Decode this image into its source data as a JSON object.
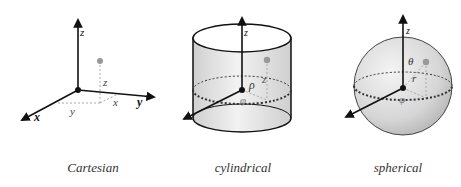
{
  "panels": [
    {
      "id": "cartesian",
      "caption": "Cartesian",
      "axis_labels": {
        "x": "x",
        "y": "y",
        "z": "z"
      },
      "coordinate_labels": {
        "x": "x",
        "y": "y",
        "z": "z"
      }
    },
    {
      "id": "cylindrical",
      "caption": "cylindrical",
      "axis_labels": {
        "z": "z"
      },
      "coordinate_labels": {
        "rho": "ρ",
        "phi": "φ",
        "z": "z"
      }
    },
    {
      "id": "spherical",
      "caption": "spherical",
      "axis_labels": {
        "z": "z"
      },
      "coordinate_labels": {
        "r": "r",
        "theta": "θ",
        "phi": "φ"
      }
    }
  ],
  "colors": {
    "axis": "#111111",
    "point": "#999999",
    "guide": "#aaaaaa",
    "surface_light": "#f0f0f0",
    "surface_dark": "#c8c8c8"
  }
}
